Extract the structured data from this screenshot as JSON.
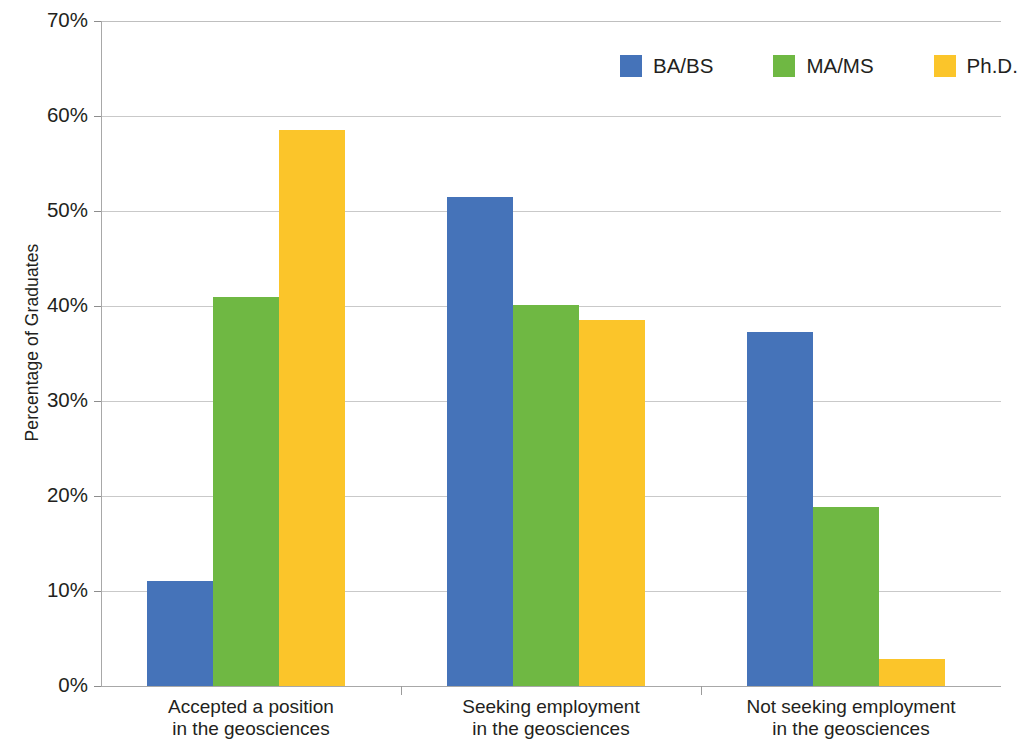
{
  "chart_data": {
    "type": "bar",
    "title": "",
    "subtitle": "",
    "xlabel": "",
    "ylabel": "Percentage of Graduates",
    "ylim": [
      0,
      70
    ],
    "y_tick_labels": [
      "70%",
      "60%",
      "50%",
      "40%",
      "30%",
      "20%",
      "10%",
      "0%"
    ],
    "y_tick_values": [
      70,
      60,
      50,
      40,
      30,
      20,
      10,
      0
    ],
    "grid": "horizontal",
    "legend_position": "top-right",
    "categories": [
      "Accepted a position in the geosciences",
      "Seeking employment in the geosciences",
      "Not seeking employment in the geosciences"
    ],
    "category_lines": [
      [
        "Accepted a position",
        "in the geosciences"
      ],
      [
        "Seeking employment",
        "in the geosciences"
      ],
      [
        "Not seeking employment",
        "in the geosciences"
      ]
    ],
    "series": [
      {
        "name": "BA/BS",
        "color": "#4573b9",
        "values": [
          11.1,
          51.5,
          37.3
        ]
      },
      {
        "name": "MA/MS",
        "color": "#6fb843",
        "values": [
          40.9,
          40.1,
          18.8
        ]
      },
      {
        "name": "Ph.D.",
        "color": "#fbc52a",
        "values": [
          58.5,
          38.5,
          2.8
        ]
      }
    ]
  },
  "legend": {
    "items": [
      {
        "label": "BA/BS",
        "color": "#4573b9"
      },
      {
        "label": "MA/MS",
        "color": "#6fb843"
      },
      {
        "label": "Ph.D.",
        "color": "#fbc52a"
      }
    ]
  },
  "axis": {
    "y_title": "Percentage of Graduates"
  }
}
